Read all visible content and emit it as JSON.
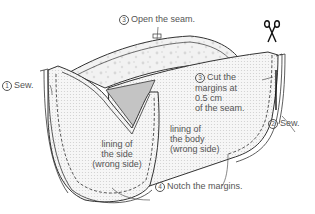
{
  "diagram": {
    "type": "sewing-instruction",
    "colors": {
      "outline": "#333333",
      "fabric_dots": "#e6e6e6",
      "print_fabric": "#eeeeee",
      "shade": "#bdbdbd",
      "text": "#555555"
    },
    "steps": [
      {
        "number": "1",
        "circled": "①",
        "text": "Sew."
      },
      {
        "number": "2",
        "circled": "②",
        "text": "Sew."
      },
      {
        "number": "3",
        "circled": "③",
        "text": "Open the seam."
      },
      {
        "number": "3",
        "circled": "③",
        "text": "Cut the margins at 0.5 cm of the seam",
        "lines": [
          "Cut the",
          "margins at",
          "0.5 cm",
          "of the seam."
        ]
      },
      {
        "number": "4",
        "circled": "④",
        "text": "Notch the margins."
      }
    ],
    "parts": [
      {
        "name": "lining-of-the-side",
        "lines": [
          "lining of",
          "the side",
          "(wrong side)"
        ]
      },
      {
        "name": "lining-of-the-body",
        "lines": [
          "lining of",
          "the body",
          "(wrong side)"
        ]
      }
    ],
    "icons": [
      "scissors-icon"
    ]
  }
}
